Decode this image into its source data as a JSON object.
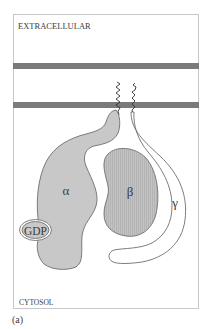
{
  "diagram": {
    "regions": {
      "top_label": "EXTRACELLULAR",
      "bottom_label": "CYTOSOL"
    },
    "subunits": [
      {
        "name": "alpha",
        "label": "α",
        "fill": "#c8c8c8"
      },
      {
        "name": "beta",
        "label": "β",
        "fill": "#bdbdbd"
      },
      {
        "name": "gamma",
        "label": "γ",
        "fill": "#ffffff"
      }
    ],
    "ligand": {
      "label": "GDP"
    },
    "panel_label": "(a)",
    "colors": {
      "membrane": "#7a7a7a",
      "border": "#c8c8c8",
      "outline": "#6e6e6e"
    }
  }
}
